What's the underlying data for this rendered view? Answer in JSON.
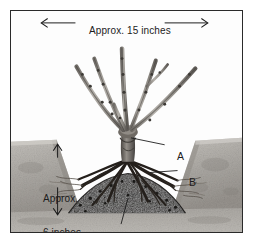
{
  "figure": {
    "kind": "photographic-diagram",
    "background_color": "#ffffff",
    "frame_color": "#2a2a2a"
  },
  "dimensions": {
    "top": {
      "text": "Approx. 15 inches",
      "orientation": "horizontal",
      "arrow": "double-headed",
      "measures": "spread of the canes"
    },
    "left": {
      "line1": "Approx.",
      "line2": "6 inches",
      "orientation": "vertical",
      "arrow": "double-headed",
      "measures": "depth of the planting hole"
    }
  },
  "callouts": [
    {
      "key": "A",
      "label": "A",
      "points_to": "bud union / crown where the canes meet"
    },
    {
      "key": "B",
      "label": "B",
      "points_to": "spread roots"
    },
    {
      "key": "C",
      "label": "C",
      "points_to": "cone of soil in the bottom of the hole"
    }
  ],
  "colors": {
    "soil_light": "#b8b5b0",
    "soil_mid": "#9d9a95",
    "soil_dark": "#3a3733",
    "mound_dark": "#1e1c19",
    "cane_light": "#b0aca6",
    "cane_mid": "#8a8680",
    "cane_dark": "#4a4743",
    "root_dark": "#241f1b",
    "ink": "#1c1c1c"
  }
}
